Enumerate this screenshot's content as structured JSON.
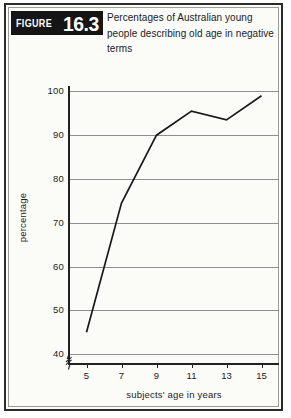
{
  "figure": {
    "banner_word": "FIGURE",
    "banner_number": "16.3",
    "title": "Percentages of Australian young people describing old age in negative terms",
    "banner_color": "#151515",
    "frame_color": "#2b2b2b",
    "background_color": "#fbfbf8"
  },
  "chart_data": {
    "type": "line",
    "title": "Percentages of Australian young people describing old age in negative terms",
    "xlabel": "subjects' age in years",
    "ylabel": "percentage",
    "x": [
      5,
      7,
      9,
      11,
      13,
      15
    ],
    "values": [
      45,
      74.5,
      90,
      95.5,
      93.5,
      99
    ],
    "xtick_labels": [
      "5",
      "7",
      "9",
      "11",
      "13",
      "15"
    ],
    "ytick_labels": [
      "40",
      "50",
      "60",
      "70",
      "80",
      "90",
      "100"
    ],
    "yticks": [
      40,
      50,
      60,
      70,
      80,
      90,
      100
    ],
    "xlim": [
      4,
      16
    ],
    "ylim": [
      38,
      101
    ],
    "grid": "horizontal",
    "legend": "none",
    "axis_break": "y-axis broken below 40",
    "line_color": "#1a1a1a",
    "grid_color": "#8e8e8e"
  }
}
